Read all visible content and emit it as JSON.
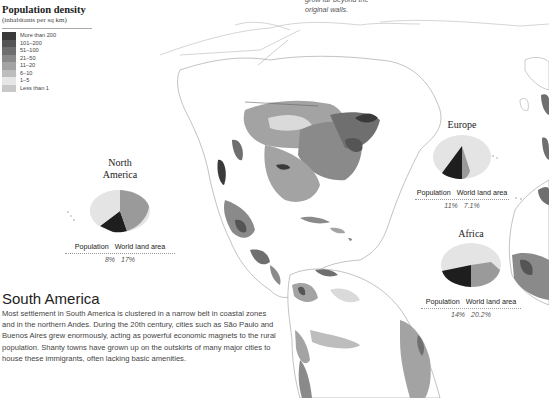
{
  "legend": {
    "title": "Population density",
    "subtitle": "(inhabitants per sq km)",
    "items": [
      {
        "label": "More than 200",
        "color": "#3a3a3a"
      },
      {
        "label": "101–200",
        "color": "#555555"
      },
      {
        "label": "51–100",
        "color": "#6f6f6f"
      },
      {
        "label": "21–50",
        "color": "#8a8a8a"
      },
      {
        "label": "11–20",
        "color": "#a3a3a3"
      },
      {
        "label": "6–10",
        "color": "#bdbdbd"
      },
      {
        "label": "1–5",
        "color": "#dadada"
      },
      {
        "label": "Less than 1",
        "color": "#c8c8c8"
      }
    ]
  },
  "top_note": {
    "line1": "grow far beyond the",
    "line2": "original walls."
  },
  "regions": {
    "north_america": {
      "title_line1": "North",
      "title_line2": "America",
      "population_label": "Population",
      "land_label": "World land area",
      "population_value": "8%",
      "land_value": "17%"
    },
    "europe": {
      "title": "Europe",
      "population_label": "Population",
      "land_label": "World land area",
      "population_value": "11%",
      "land_value": "7.1%"
    },
    "africa": {
      "title": "Africa",
      "population_label": "Population",
      "land_label": "World land area",
      "population_value": "14%",
      "land_value": "20.2%"
    }
  },
  "south_america": {
    "title": "South America",
    "body": "Most settlement in South America is clustered in a narrow belt in coastal zones and in the northern Andes. During the 20th century, cities such as São Paulo and Buenos Aires grew enormously, acting as powerful economic magnets to the rural population. Shanty towns have grown up on the outskirts of many major cities to house these immigrants, often lacking basic amenities."
  },
  "colors": {
    "pie_base": "#e4e4e4",
    "pie_population": "#1e1e1e",
    "pie_land": "#9a9a9a",
    "border": "#9a9a9a"
  }
}
